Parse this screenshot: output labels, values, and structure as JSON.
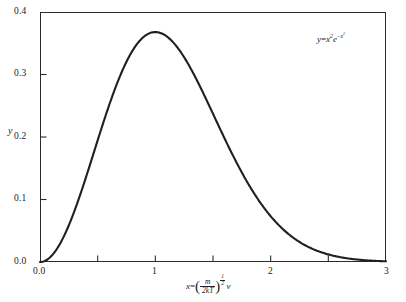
{
  "chart_data": {
    "type": "line",
    "title": "",
    "subtitle": "",
    "xlabel": "x = (m/2kT)^(1/2) v",
    "ylabel": "y",
    "xlim": [
      0,
      3
    ],
    "ylim": [
      0,
      0.4
    ],
    "grid": false,
    "legend": "none",
    "annotation": "y = x²e^(−x²)",
    "x_ticks_labeled": [
      "0.0",
      "1",
      "2",
      "3"
    ],
    "x_ticks_labeled_values": [
      0,
      1,
      2,
      3
    ],
    "x_ticks_minor_values": [
      0.5,
      1.5,
      2.5
    ],
    "y_ticks_labeled": [
      "0.0",
      "0.1",
      "0.2",
      "0.3",
      "0.4"
    ],
    "y_ticks_labeled_values": [
      0.0,
      0.1,
      0.2,
      0.3,
      0.4
    ],
    "series": [
      {
        "name": "y = x^2 e^{-x^2}",
        "color": "#231f1e",
        "x": [
          0.0,
          0.1,
          0.2,
          0.3,
          0.4,
          0.5,
          0.6,
          0.7,
          0.8,
          0.9,
          1.0,
          1.1,
          1.2,
          1.3,
          1.4,
          1.5,
          1.6,
          1.7,
          1.8,
          1.9,
          2.0,
          2.1,
          2.2,
          2.3,
          2.4,
          2.5,
          2.6,
          2.7,
          2.8,
          2.9,
          3.0
        ],
        "values": [
          0.0,
          0.0099,
          0.0384,
          0.0823,
          0.1363,
          0.1947,
          0.2518,
          0.3011,
          0.3374,
          0.3581,
          0.3679,
          0.3585,
          0.3406,
          0.3118,
          0.2767,
          0.2369,
          0.1972,
          0.1597,
          0.1264,
          0.0979,
          0.0733,
          0.054,
          0.039,
          0.0276,
          0.0191,
          0.013,
          0.0086,
          0.0056,
          0.0036,
          0.0022,
          0.0014
        ]
      }
    ]
  },
  "axis": {
    "y_tick_labels": [
      "0.4",
      "0.3",
      "0.2",
      "0.1",
      "0.0"
    ],
    "x_tick_labels": [
      "0.0",
      "1",
      "2",
      "3"
    ],
    "y_axis_title": "y"
  },
  "annotation": {
    "equation_lhs": "y",
    "equation_eq": "=",
    "equation_base": "x",
    "equation_base_exp": "2",
    "equation_e": "e",
    "equation_e_exp_minus": "−",
    "equation_e_exp_base": "x",
    "equation_e_exp_sup": "2"
  },
  "x_caption": {
    "lhs": "x",
    "eq": "=",
    "numerator": "m",
    "denominator": "2kT",
    "paren_open": "(",
    "paren_close": ")",
    "exp_num": "1",
    "exp_den": "2",
    "variable": "v"
  }
}
